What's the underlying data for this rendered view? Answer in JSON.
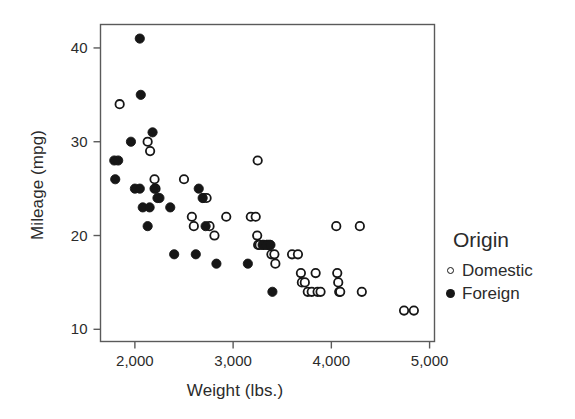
{
  "chart_data": {
    "type": "scatter",
    "title": "",
    "xlabel": "Weight (lbs.)",
    "ylabel": "Mileage (mpg)",
    "xlim": [
      1650,
      5050
    ],
    "ylim": [
      8.7,
      42.5
    ],
    "xticks": [
      2000,
      3000,
      4000,
      5000
    ],
    "xticklabels": [
      "2,000",
      "3,000",
      "4,000",
      "5,000"
    ],
    "yticks": [
      10,
      20,
      30,
      40
    ],
    "yticklabels": [
      "10",
      "20",
      "30",
      "40"
    ],
    "grid": false,
    "legend": {
      "title": "Origin",
      "position": "right",
      "entries": [
        {
          "label": "Domestic",
          "marker": "open-circle",
          "color": "#161616"
        },
        {
          "label": "Foreign",
          "marker": "filled-circle",
          "color": "#161616"
        }
      ]
    },
    "series": [
      {
        "name": "Domestic",
        "marker": "open-circle",
        "points": [
          [
            1845,
            34
          ],
          [
            2130,
            30
          ],
          [
            2155,
            29
          ],
          [
            2200,
            26
          ],
          [
            2210,
            25
          ],
          [
            2500,
            26
          ],
          [
            2580,
            22
          ],
          [
            2600,
            21
          ],
          [
            2700,
            24
          ],
          [
            2730,
            24
          ],
          [
            2760,
            21
          ],
          [
            2810,
            20
          ],
          [
            2930,
            22
          ],
          [
            3180,
            22
          ],
          [
            3230,
            22
          ],
          [
            3250,
            28
          ],
          [
            3245,
            20
          ],
          [
            3255,
            19
          ],
          [
            3270,
            19
          ],
          [
            3310,
            19
          ],
          [
            3350,
            19
          ],
          [
            3370,
            19
          ],
          [
            3390,
            18
          ],
          [
            3420,
            18
          ],
          [
            3430,
            17
          ],
          [
            3600,
            18
          ],
          [
            3660,
            18
          ],
          [
            3690,
            16
          ],
          [
            3700,
            15
          ],
          [
            3730,
            15
          ],
          [
            3760,
            14
          ],
          [
            3800,
            14
          ],
          [
            3840,
            16
          ],
          [
            3860,
            14
          ],
          [
            3890,
            14
          ],
          [
            4050,
            21
          ],
          [
            4060,
            16
          ],
          [
            4070,
            15
          ],
          [
            4080,
            14
          ],
          [
            4090,
            14
          ],
          [
            4290,
            21
          ],
          [
            4310,
            14
          ],
          [
            4740,
            12
          ],
          [
            4840,
            12
          ]
        ]
      },
      {
        "name": "Foreign",
        "marker": "filled-circle",
        "points": [
          [
            2050,
            41
          ],
          [
            2060,
            35
          ],
          [
            1790,
            28
          ],
          [
            1830,
            28
          ],
          [
            1800,
            26
          ],
          [
            1960,
            30
          ],
          [
            2000,
            25
          ],
          [
            2050,
            25
          ],
          [
            2080,
            23
          ],
          [
            2150,
            23
          ],
          [
            2180,
            31
          ],
          [
            2200,
            25
          ],
          [
            2230,
            24
          ],
          [
            2250,
            24
          ],
          [
            2130,
            21
          ],
          [
            2360,
            23
          ],
          [
            2400,
            18
          ],
          [
            2620,
            18
          ],
          [
            2650,
            25
          ],
          [
            2690,
            24
          ],
          [
            2720,
            21
          ],
          [
            2830,
            17
          ],
          [
            3150,
            17
          ],
          [
            3300,
            19
          ],
          [
            3340,
            19
          ],
          [
            3380,
            19
          ],
          [
            3400,
            14
          ]
        ]
      }
    ]
  }
}
